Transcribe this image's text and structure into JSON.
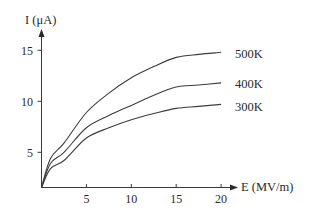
{
  "chart_data": {
    "type": "line",
    "title": "",
    "xlabel": "E (MV/m)",
    "ylabel": "I (μA)",
    "xlim": [
      0,
      21.5
    ],
    "ylim": [
      1.6,
      17
    ],
    "x_ticks": [
      5,
      10,
      15,
      20
    ],
    "y_ticks": [
      5,
      10,
      15
    ],
    "grid": false,
    "legend": "inline labels at right end of each curve",
    "x": [
      0,
      1,
      2.5,
      5,
      7.5,
      10,
      12.5,
      15,
      17.5,
      20
    ],
    "series": [
      {
        "name": "500K",
        "values": [
          1.6,
          4.4,
          5.9,
          8.9,
          10.8,
          12.3,
          13.4,
          14.3,
          14.6,
          14.8
        ]
      },
      {
        "name": "400K",
        "values": [
          1.6,
          3.9,
          5.0,
          7.4,
          8.6,
          9.6,
          10.6,
          11.4,
          11.6,
          11.8
        ]
      },
      {
        "name": "300K",
        "values": [
          1.6,
          3.4,
          4.2,
          6.4,
          7.4,
          8.2,
          8.8,
          9.3,
          9.5,
          9.7
        ]
      }
    ]
  },
  "axes": {
    "x_label": "E (MV/m)",
    "y_label": "I (μA)",
    "x_tick_labels": [
      "5",
      "10",
      "15",
      "20"
    ],
    "y_tick_labels": [
      "5",
      "10",
      "15"
    ]
  },
  "labels": {
    "series_500": "500K",
    "series_400": "400K",
    "series_300": "300K"
  },
  "colors": {
    "line": "#3c3c3c",
    "text": "#2a2a2a",
    "background": "#ffffff"
  }
}
